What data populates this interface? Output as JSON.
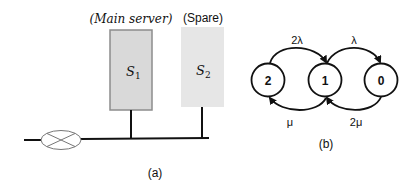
{
  "figure_a": {
    "caption": "(a)",
    "main_server": {
      "heading": "(Main server)",
      "label": "S",
      "subscript": "1",
      "fill": "#d9d9d9",
      "border": "#8c8c8c"
    },
    "spare_server": {
      "heading": "(Spare)",
      "label": "S",
      "subscript": "2",
      "fill": "#e6e6e6"
    },
    "switch_icon": "crossed-ellipse"
  },
  "figure_b": {
    "caption": "(b)",
    "states": [
      {
        "id": "2",
        "label": "2"
      },
      {
        "id": "1",
        "label": "1"
      },
      {
        "id": "0",
        "label": "0"
      }
    ],
    "transitions": [
      {
        "from": "2",
        "to": "1",
        "rate": "2λ"
      },
      {
        "from": "1",
        "to": "0",
        "rate": "λ"
      },
      {
        "from": "1",
        "to": "2",
        "rate": "μ"
      },
      {
        "from": "0",
        "to": "1",
        "rate": "2μ"
      }
    ]
  }
}
